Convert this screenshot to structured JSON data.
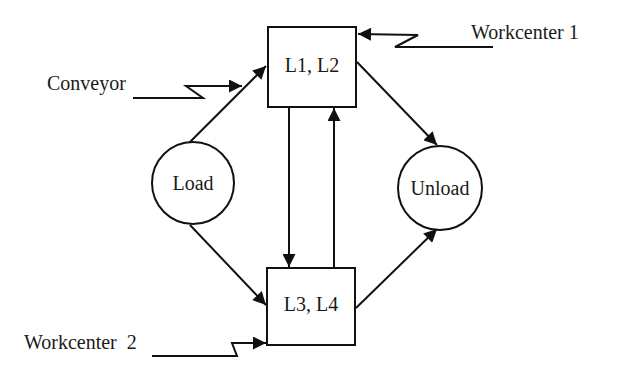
{
  "diagram": {
    "nodes": [
      {
        "id": "load",
        "label": "Load",
        "shape": "circle"
      },
      {
        "id": "unload",
        "label": "Unload",
        "shape": "circle"
      },
      {
        "id": "box1",
        "label": "L1, L2",
        "shape": "rect"
      },
      {
        "id": "box2",
        "label": "L3, L4",
        "shape": "rect"
      }
    ],
    "external_inputs": [
      {
        "id": "conveyor",
        "label": "Conveyor",
        "target": "box1"
      },
      {
        "id": "workcenter1",
        "label": "Workcenter 1",
        "target": "box1"
      },
      {
        "id": "workcenter2",
        "label": "Workcenter  2",
        "target": "box2"
      }
    ],
    "edges": [
      {
        "from": "load",
        "to": "box1"
      },
      {
        "from": "load",
        "to": "box2"
      },
      {
        "from": "box1",
        "to": "unload"
      },
      {
        "from": "box2",
        "to": "unload"
      },
      {
        "from": "box1",
        "to": "box2"
      },
      {
        "from": "box2",
        "to": "box1"
      }
    ],
    "colors": {
      "stroke": "#111111",
      "text": "#1a1a1a",
      "background": "#ffffff"
    }
  }
}
